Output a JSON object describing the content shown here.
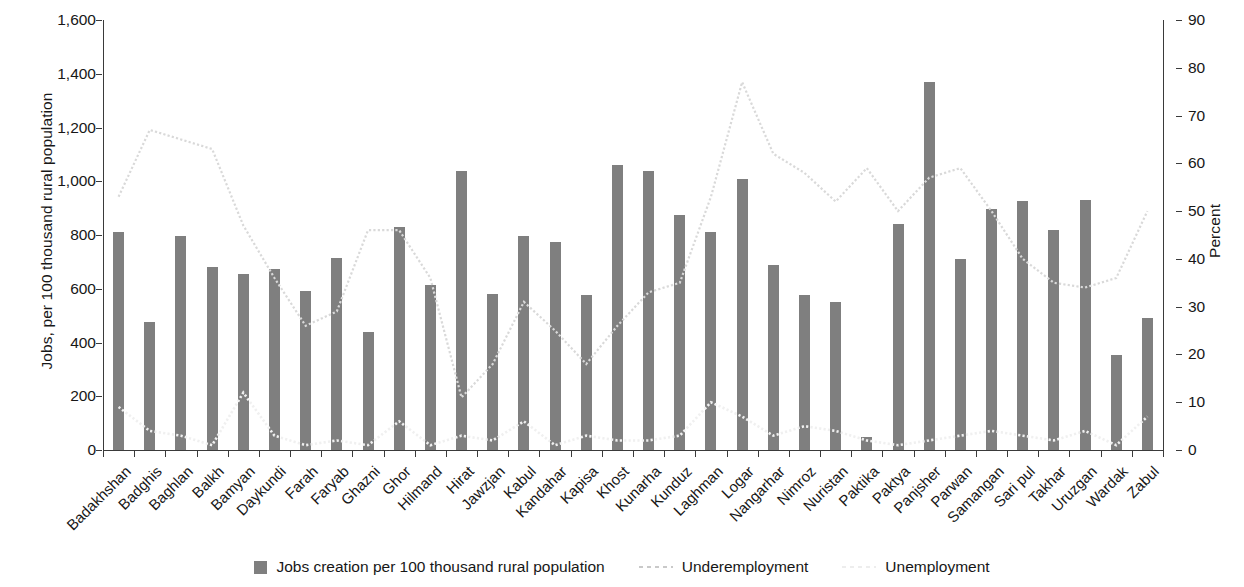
{
  "chart_data": {
    "type": "bar",
    "title": "",
    "subtitle": "",
    "xlabel": "",
    "ylabel": "Jobs, per 100 thousand rural population",
    "y2label": "Percent",
    "ylim": [
      0,
      1600
    ],
    "y2lim": [
      0,
      90
    ],
    "yticks": [
      "0",
      "200",
      "400",
      "600",
      "800",
      "1,000",
      "1,200",
      "1,400",
      "1,600"
    ],
    "ytick_values": [
      0,
      200,
      400,
      600,
      800,
      1000,
      1200,
      1400,
      1600
    ],
    "y2ticks": [
      "0",
      "10",
      "20",
      "30",
      "40",
      "50",
      "60",
      "70",
      "80",
      "90"
    ],
    "y2tick_values": [
      0,
      10,
      20,
      30,
      40,
      50,
      60,
      70,
      80,
      90
    ],
    "grid": false,
    "legend_position": "bottom",
    "categories": [
      "Badakhshan",
      "Badghis",
      "Baghlan",
      "Balkh",
      "Bamyan",
      "Daykundi",
      "Farah",
      "Faryab",
      "Ghazni",
      "Ghor",
      "Hilmand",
      "Hirat",
      "Jawzjan",
      "Kabul",
      "Kandahar",
      "Kapisa",
      "Khost",
      "Kunarha",
      "Kunduz",
      "Laghman",
      "Logar",
      "Nangarhar",
      "Nimroz",
      "Nuristan",
      "Paktika",
      "Paktya",
      "Panjsher",
      "Parwan",
      "Samangan",
      "Sari pul",
      "Takhar",
      "Uruzgan",
      "Wardak",
      "Zabul"
    ],
    "series": [
      {
        "name": "Jobs creation per 100 thousand rural population",
        "axis": "left",
        "type": "bar",
        "color": "#7f7f7f",
        "values": [
          810,
          475,
          795,
          680,
          655,
          675,
          590,
          715,
          440,
          830,
          615,
          1040,
          580,
          795,
          775,
          575,
          1060,
          1040,
          875,
          810,
          1010,
          690,
          575,
          550,
          50,
          840,
          1370,
          710,
          895,
          925,
          820,
          930,
          355,
          490
        ]
      },
      {
        "name": "Underemployment",
        "axis": "right",
        "type": "line",
        "color": "#d9d9d9",
        "values": [
          53,
          67,
          65,
          63,
          47,
          36,
          26,
          29,
          46,
          46,
          36,
          11,
          18,
          31,
          25,
          18,
          26,
          33,
          35,
          53,
          77,
          62,
          58,
          52,
          59,
          50,
          57,
          59,
          50,
          40,
          35,
          34,
          36,
          50
        ]
      },
      {
        "name": "Unemployment",
        "axis": "right",
        "type": "line",
        "color": "#f0f0f0",
        "values": [
          9,
          4,
          3,
          1,
          12,
          3,
          1,
          2,
          1,
          6,
          1,
          3,
          2,
          6,
          1,
          3,
          2,
          2,
          3,
          10,
          7,
          3,
          5,
          4,
          2,
          1,
          2,
          3,
          4,
          3,
          2,
          4,
          1,
          7
        ]
      }
    ]
  },
  "legend": {
    "items": [
      {
        "label": "Jobs creation per 100 thousand rural population",
        "marker": "bar-swatch",
        "color": "#7f7f7f"
      },
      {
        "label": "Underemployment",
        "marker": "dotted-line",
        "color": "#c9c9c9"
      },
      {
        "label": "Unemployment",
        "marker": "dotted-line",
        "color": "#ededed"
      }
    ]
  }
}
